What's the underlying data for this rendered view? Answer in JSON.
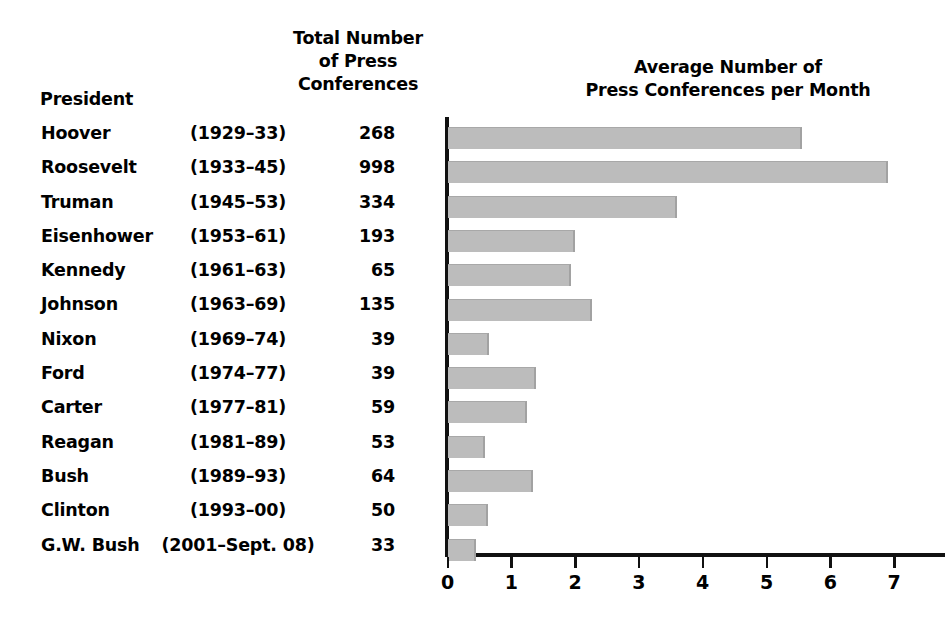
{
  "headers": {
    "president": "President",
    "total_line1": "Total Number",
    "total_line2": "of Press",
    "total_line3": "Conferences",
    "average_line1": "Average Number of",
    "average_line2": "Press Conferences per Month"
  },
  "rows": [
    {
      "president": "Hoover",
      "term": "(1929–33)",
      "total": "268",
      "avg": 5.56
    },
    {
      "president": "Roosevelt",
      "term": "(1933–45)",
      "total": "998",
      "avg": 6.9
    },
    {
      "president": "Truman",
      "term": "(1945–53)",
      "total": "334",
      "avg": 3.59
    },
    {
      "president": "Eisenhower",
      "term": "(1953–61)",
      "total": "193",
      "avg": 2.0
    },
    {
      "president": "Kennedy",
      "term": "(1961–63)",
      "total": "65",
      "avg": 1.94
    },
    {
      "president": "Johnson",
      "term": "(1963–69)",
      "total": "135",
      "avg": 2.27
    },
    {
      "president": "Nixon",
      "term": "(1969–74)",
      "total": "39",
      "avg": 0.65
    },
    {
      "president": "Ford",
      "term": "(1974–77)",
      "total": "39",
      "avg": 1.38
    },
    {
      "president": "Carter",
      "term": "(1977–81)",
      "total": "59",
      "avg": 1.25
    },
    {
      "president": "Reagan",
      "term": "(1981–89)",
      "total": "53",
      "avg": 0.59
    },
    {
      "president": "Bush",
      "term": "(1989–93)",
      "total": "64",
      "avg": 1.34
    },
    {
      "president": "Clinton",
      "term": "(1993–00)",
      "total": "50",
      "avg": 0.64
    },
    {
      "president": "G.W. Bush",
      "term": "(2001–Sept. 08)",
      "total": "33",
      "avg": 0.45
    }
  ],
  "axis": {
    "ticks": [
      "0",
      "1",
      "2",
      "3",
      "4",
      "5",
      "6",
      "7"
    ]
  },
  "colors": {
    "bar_fill": "#bcbcbc",
    "bar_edge": "#a2a2a2",
    "axis": "#111111",
    "text": "#000000",
    "background": "#ffffff"
  },
  "chart_data": {
    "type": "bar",
    "orientation": "horizontal",
    "title": "Average Number of Press Conferences per Month",
    "xlabel": "",
    "ylabel": "",
    "xlim": [
      0,
      7.7
    ],
    "grid": false,
    "legend": false,
    "categories": [
      "Hoover",
      "Roosevelt",
      "Truman",
      "Eisenhower",
      "Kennedy",
      "Johnson",
      "Nixon",
      "Ford",
      "Carter",
      "Reagan",
      "Bush",
      "Clinton",
      "G.W. Bush"
    ],
    "values": [
      5.56,
      6.9,
      3.59,
      2.0,
      1.94,
      2.27,
      0.65,
      1.38,
      1.25,
      0.59,
      1.34,
      0.64,
      0.45
    ],
    "xticks": [
      0,
      1,
      2,
      3,
      4,
      5,
      6,
      7
    ],
    "table_columns": [
      "President",
      "Term",
      "Total Number of Press Conferences"
    ],
    "terms": [
      "(1929–33)",
      "(1933–45)",
      "(1945–53)",
      "(1953–61)",
      "(1961–63)",
      "(1963–69)",
      "(1969–74)",
      "(1974–77)",
      "(1977–81)",
      "(1981–89)",
      "(1989–93)",
      "(1993–00)",
      "(2001–Sept. 08)"
    ],
    "totals": [
      268,
      998,
      334,
      193,
      65,
      135,
      39,
      39,
      59,
      53,
      64,
      50,
      33
    ]
  }
}
